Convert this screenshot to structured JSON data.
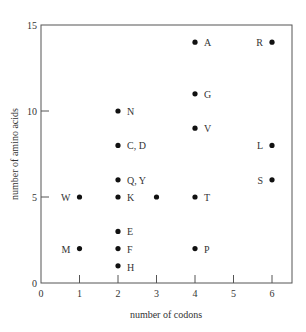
{
  "chart_data": {
    "type": "scatter",
    "title": "",
    "xlabel": "number of codons",
    "ylabel": "number of amino acids",
    "xlim": [
      0,
      6.5
    ],
    "ylim": [
      0,
      15
    ],
    "xticks": [
      0,
      1,
      2,
      3,
      4,
      5,
      6
    ],
    "yticks": [
      0,
      5,
      10,
      15
    ],
    "grid": false,
    "legend": null,
    "points": [
      {
        "x": 4,
        "y": 14,
        "label": "A",
        "label_side": "right"
      },
      {
        "x": 6,
        "y": 14,
        "label": "R",
        "label_side": "left"
      },
      {
        "x": 4,
        "y": 11,
        "label": "G",
        "label_side": "right"
      },
      {
        "x": 2,
        "y": 10,
        "label": "N",
        "label_side": "right"
      },
      {
        "x": 4,
        "y": 9,
        "label": "V",
        "label_side": "right"
      },
      {
        "x": 2,
        "y": 8,
        "label": "C, D",
        "label_side": "right"
      },
      {
        "x": 6,
        "y": 8,
        "label": "L",
        "label_side": "left"
      },
      {
        "x": 2,
        "y": 6,
        "label": "Q, Y",
        "label_side": "right"
      },
      {
        "x": 6,
        "y": 6,
        "label": "S",
        "label_side": "left"
      },
      {
        "x": 1,
        "y": 5,
        "label": "W",
        "label_side": "left"
      },
      {
        "x": 2,
        "y": 5,
        "label": "K",
        "label_side": "right"
      },
      {
        "x": 3,
        "y": 5,
        "label": "",
        "label_side": "none"
      },
      {
        "x": 4,
        "y": 5,
        "label": "T",
        "label_side": "right"
      },
      {
        "x": 2,
        "y": 3,
        "label": "E",
        "label_side": "right"
      },
      {
        "x": 1,
        "y": 2,
        "label": "M",
        "label_side": "left"
      },
      {
        "x": 2,
        "y": 2,
        "label": "F",
        "label_side": "right"
      },
      {
        "x": 4,
        "y": 2,
        "label": "P",
        "label_side": "right"
      },
      {
        "x": 2,
        "y": 1,
        "label": "H",
        "label_side": "right"
      }
    ]
  },
  "colors": {
    "axis": "#555555",
    "point": "#111111",
    "text": "#333333"
  }
}
